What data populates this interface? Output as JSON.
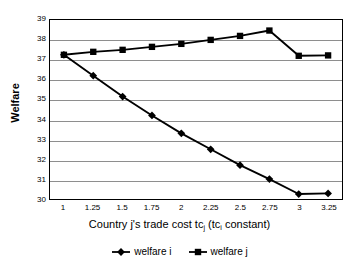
{
  "chart_data": {
    "type": "line",
    "title": "",
    "xlabel": "Country j's trade cost tc_j (tc_i constant)",
    "ylabel": "Welfare",
    "grid": true,
    "legend_position": "bottom",
    "xlim": [
      1,
      3.25
    ],
    "ylim": [
      30,
      39
    ],
    "x": [
      1,
      1.25,
      1.5,
      1.75,
      2,
      2.25,
      2.5,
      2.75,
      3,
      3.25
    ],
    "x_tick_labels": [
      "1",
      "1.25",
      "1.5",
      "1.75",
      "2",
      "2.25",
      "2.5",
      "2.75",
      "3",
      "3.25"
    ],
    "y_tick_labels": [
      "39",
      "38",
      "37",
      "36",
      "35",
      "34",
      "33",
      "32",
      "31",
      "30"
    ],
    "y_ticks": [
      39,
      38,
      37,
      36,
      35,
      34,
      33,
      32,
      31,
      30
    ],
    "series": [
      {
        "name": "welfare i",
        "marker": "diamond",
        "color": "#000000",
        "values": [
          37.25,
          36.2,
          35.15,
          34.2,
          33.3,
          32.5,
          31.7,
          31.0,
          30.25,
          30.28
        ]
      },
      {
        "name": "welfare j",
        "marker": "square",
        "color": "#000000",
        "values": [
          37.25,
          37.4,
          37.5,
          37.65,
          37.8,
          38.0,
          38.2,
          38.47,
          37.2,
          37.22
        ]
      }
    ]
  },
  "axis": {
    "y_title": "Welfare",
    "x_title_part1": "Country j's trade cost tc",
    "x_title_sub1": "j",
    "x_title_part2": " (tc",
    "x_title_sub2": "i",
    "x_title_part3": " constant)"
  },
  "legend": {
    "items": [
      {
        "label": "welfare i",
        "marker": "diamond"
      },
      {
        "label": "welfare j",
        "marker": "square"
      }
    ]
  }
}
